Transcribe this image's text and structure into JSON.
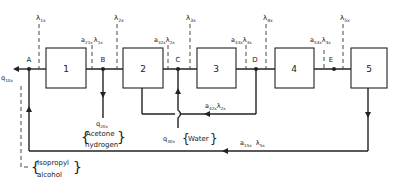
{
  "diagram": {
    "units": [
      {
        "id": "1",
        "label": "1"
      },
      {
        "id": "2",
        "label": "2"
      },
      {
        "id": "3",
        "label": "3"
      },
      {
        "id": "4",
        "label": "4"
      },
      {
        "id": "5",
        "label": "5"
      }
    ],
    "nodes": [
      {
        "id": "A",
        "label": "A"
      },
      {
        "id": "B",
        "label": "B"
      },
      {
        "id": "C",
        "label": "C"
      },
      {
        "id": "D",
        "label": "D"
      },
      {
        "id": "E",
        "label": "E"
      }
    ],
    "lambda_labels": {
      "l1": {
        "main": "λ",
        "sub": "1x"
      },
      "l2": {
        "main": "λ",
        "sub": "2x"
      },
      "l3": {
        "main": "λ",
        "sub": "3x"
      },
      "l4": {
        "main": "λ",
        "sub": "4x"
      },
      "l5": {
        "main": "λ",
        "sub": "5x"
      }
    },
    "flow_labels": {
      "a21": {
        "a": "a",
        "asub": "21x",
        "l": "λ",
        "lsub": "1x"
      },
      "a32": {
        "a": "a",
        "asub": "32x",
        "l": "λ",
        "lsub": "2x"
      },
      "a43": {
        "a": "a",
        "asub": "43x",
        "l": "λ",
        "lsub": "3x"
      },
      "a54": {
        "a": "a",
        "asub": "54x",
        "l": "λ",
        "lsub": "4x"
      },
      "a42": {
        "a": "a",
        "asub": "42x",
        "l": "λ",
        "lsub": "2x"
      },
      "a15": {
        "a": "a",
        "asub": "15x",
        "l": "λ",
        "lsub": "5x"
      }
    },
    "feeds": {
      "q10": {
        "q": "q",
        "sub": "10x"
      },
      "q20": {
        "q": "q",
        "sub": "20x",
        "line1": "Acetone",
        "line2": "hydrogen"
      },
      "q30": {
        "q": "q",
        "sub": "30x",
        "text": "Water"
      },
      "isopropyl": {
        "line1": "Isopropyl",
        "line2": "alcohol"
      }
    },
    "colors": {
      "line": "#222222",
      "dash": "#333333",
      "background": "#ffffff"
    }
  }
}
